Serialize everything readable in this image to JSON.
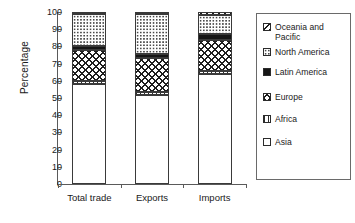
{
  "chart_data": {
    "type": "bar",
    "subtype": "stacked-bar-100",
    "title": "",
    "subtitle": "",
    "xlabel": "",
    "ylabel": "Percentage",
    "ylim": [
      0,
      100
    ],
    "yticks": [
      0,
      10,
      20,
      30,
      40,
      50,
      60,
      70,
      80,
      90,
      100
    ],
    "ytick_labels": [
      "0",
      "10",
      "20",
      "30",
      "40",
      "50",
      "60",
      "70",
      "80",
      "90",
      "100"
    ],
    "grid": false,
    "legend_position": "right",
    "categories": [
      "Total trade",
      "Exports",
      "Imports"
    ],
    "series": [
      {
        "name": "Asia",
        "pattern": "solid-white",
        "values": [
          58.0,
          52.0,
          64.0
        ]
      },
      {
        "name": "Africa",
        "pattern": "vertical-lines",
        "values": [
          2.0,
          1.5,
          1.5
        ]
      },
      {
        "name": "Europe",
        "pattern": "cross-hatch",
        "values": [
          18.0,
          19.5,
          18.5
        ]
      },
      {
        "name": "Latin America",
        "pattern": "solid-black",
        "values": [
          2.5,
          2.5,
          3.0
        ]
      },
      {
        "name": "North America",
        "pattern": "dotted",
        "values": [
          18.5,
          23.5,
          11.0
        ]
      },
      {
        "name": "Oceania and Pacific",
        "pattern": "diagonal-lines",
        "values": [
          1.0,
          1.0,
          2.0
        ]
      }
    ],
    "cumulative_tops": {
      "Total trade": {
        "Asia": 58.0,
        "Africa": 60.0,
        "Europe": 78.0,
        "Latin America": 80.5,
        "North America": 99.0,
        "Oceania and Pacific": 100.0
      },
      "Exports": {
        "Asia": 52.0,
        "Africa": 53.5,
        "Europe": 73.0,
        "Latin America": 75.5,
        "North America": 99.0,
        "Oceania and Pacific": 100.0
      },
      "Imports": {
        "Asia": 64.0,
        "Africa": 65.5,
        "Europe": 84.0,
        "Latin America": 87.0,
        "North America": 98.0,
        "Oceania and Pacific": 100.0
      }
    }
  },
  "axis": {
    "y_title": "Percentage",
    "y_tick_labels": [
      "100",
      "90",
      "80",
      "70",
      "60",
      "50",
      "40",
      "30",
      "20",
      "10",
      "0"
    ],
    "x_tick_labels": [
      "Total trade",
      "Exports",
      "Imports"
    ]
  },
  "legend": {
    "items": [
      {
        "label": "Oceania and\nPacific",
        "swatch": "diagonal-lines-swatch"
      },
      {
        "label": "North America",
        "swatch": "dotted-swatch"
      },
      {
        "label": "Latin America",
        "swatch": "solid-black-swatch"
      },
      {
        "label": "Europe",
        "swatch": "cross-hatch-swatch"
      },
      {
        "label": "Africa",
        "swatch": "vertical-lines-swatch"
      },
      {
        "label": "Asia",
        "swatch": "solid-white-swatch"
      }
    ]
  },
  "colors": {
    "ink": "#1a1a1a",
    "axis": "#5a5a5a",
    "bar_outline": "#3a3a3a",
    "latin_america": "#161616",
    "background": "#ffffff"
  }
}
